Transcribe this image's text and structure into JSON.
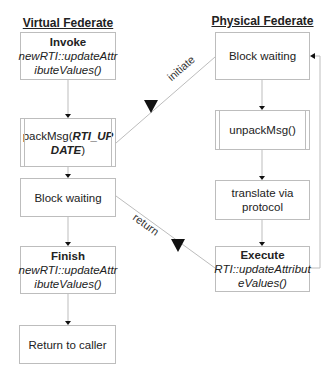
{
  "lanes": {
    "virtual": {
      "title": "Virtual Federate"
    },
    "physical": {
      "title": "Physical Federate"
    }
  },
  "virtual_nodes": {
    "invoke": {
      "title": "Invoke",
      "line1": "newRTI::updateAttr",
      "line2": "ibuteValues()"
    },
    "pack": {
      "prefix": "packMsg(",
      "arg1": "RTI_UP",
      "arg2": "DATE",
      "suffix": ")"
    },
    "block": {
      "label": "Block waiting"
    },
    "finish": {
      "title": "Finish",
      "line1": "newRTI::updateAttr",
      "line2": "ibuteValues()"
    },
    "ret": {
      "label": "Return to caller"
    }
  },
  "physical_nodes": {
    "block": {
      "label": "Block waiting"
    },
    "unpack": {
      "label": "unpackMsg()"
    },
    "translate": {
      "line1": "translate via",
      "line2": "protocol"
    },
    "execute": {
      "title": "Execute",
      "line1": "RTI::updateAttribut",
      "line2": "eValues()"
    }
  },
  "edges": {
    "initiate": {
      "label": "initiate"
    },
    "return": {
      "label": "return"
    }
  },
  "colors": {
    "line": "#bdbdbd",
    "arrow": "#111111",
    "text": "#222222"
  }
}
